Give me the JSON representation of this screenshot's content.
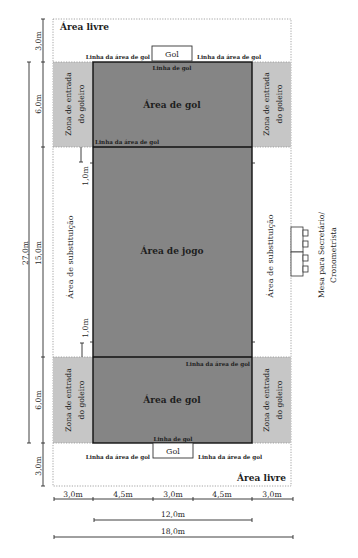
{
  "areas": {
    "free_area_top": "Área livre",
    "free_area_bottom": "Área livre",
    "goal_area_top": "Área de gol",
    "goal_area_bottom": "Área de gol",
    "play_area": "Área de jogo",
    "substitution_left": "Área de substituição",
    "substitution_right": "Área de substituição",
    "goalkeeper_zone": {
      "line1": "Zona de entrada",
      "line2": "do goleiro"
    }
  },
  "lines": {
    "goal_line": "Linha de gol",
    "goal_area_line": "Linha da área de gol"
  },
  "goal": {
    "label": "Gol"
  },
  "table": {
    "line1": "Mesa para Secretário/",
    "line2": "Cronometrista"
  },
  "dimensions": {
    "left": {
      "free_top": "3,0m",
      "goal_area_top": "6,0m",
      "court_length": "27,0m",
      "middle": "15,0m",
      "goal_area_bottom": "6,0m",
      "free_bottom": "3,0m"
    },
    "substitution_offset": "1,0m",
    "bottom_segments": [
      "3,0m",
      "4,5m",
      "3,0m",
      "4,5m",
      "3,0m"
    ],
    "court_width": "12,0m",
    "total_width": "18,0m"
  },
  "colors": {
    "court": "#858585",
    "goalkeeper_zone": "#c6c6c6",
    "lines": "#111111"
  }
}
